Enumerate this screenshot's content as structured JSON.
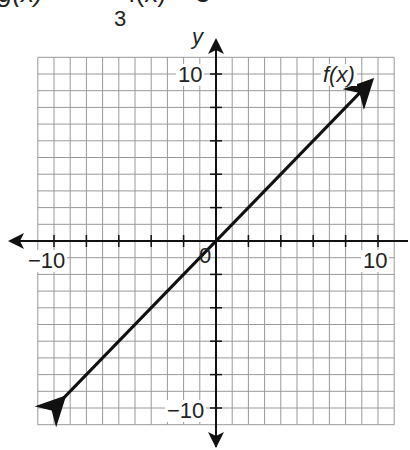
{
  "header": {
    "equation_visible": "g(x) = ",
    "equation_tail": "· f(x) + 3",
    "fraction_denominator": "3"
  },
  "chart_data": {
    "type": "line",
    "title": "",
    "xlabel": "x",
    "ylabel": "y",
    "xlim": [
      -11,
      11
    ],
    "ylim": [
      -11,
      11
    ],
    "grid": true,
    "x_tick_labels": [
      "-10",
      "10"
    ],
    "y_tick_labels": [
      "10",
      "-10"
    ],
    "origin_label": "0",
    "series": [
      {
        "name": "f(x)",
        "x": [
          -9.5,
          9.5
        ],
        "y": [
          -9.5,
          9.5
        ],
        "arrows": "both"
      }
    ]
  },
  "labels": {
    "y_axis": "y",
    "x_axis": "x",
    "x_min": "−10",
    "x_max": "10",
    "y_max": "10",
    "y_min": "−10",
    "origin": "0",
    "function": "f(x)"
  }
}
